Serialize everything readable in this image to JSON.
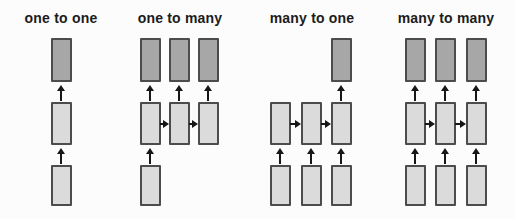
{
  "colors": {
    "background": "#fcfcfc",
    "box_border": "#4c4c4c",
    "input_fill": "#dbdbdb",
    "hidden_fill": "#dbdbdb",
    "output_fill": "#a7a7a7",
    "arrow": "#161616",
    "title_text": "#1b1b1b"
  },
  "layout": {
    "width": 515,
    "height": 219,
    "title_y": 10,
    "box_width": 21,
    "rows": {
      "output": {
        "y": 38,
        "height": 44
      },
      "hidden": {
        "y": 102,
        "height": 43
      },
      "input": {
        "y": 165,
        "height": 41
      }
    }
  },
  "panels": [
    {
      "id": "one-to-one",
      "label": "one to one",
      "title_center_x": 61,
      "columns": [
        {
          "x": 61,
          "input": true,
          "hidden": true,
          "output": true
        }
      ],
      "h_arrows": []
    },
    {
      "id": "one-to-many",
      "label": "one to many",
      "title_center_x": 180,
      "columns": [
        {
          "x": 150,
          "input": true,
          "hidden": true,
          "output": true
        },
        {
          "x": 179,
          "input": false,
          "hidden": true,
          "output": true
        },
        {
          "x": 208,
          "input": false,
          "hidden": true,
          "output": true
        }
      ],
      "h_arrows": [
        [
          0,
          1
        ],
        [
          1,
          2
        ]
      ]
    },
    {
      "id": "many-to-one",
      "label": "many to one",
      "title_center_x": 312,
      "columns": [
        {
          "x": 280,
          "input": true,
          "hidden": true,
          "output": false
        },
        {
          "x": 311,
          "input": true,
          "hidden": true,
          "output": false
        },
        {
          "x": 341,
          "input": true,
          "hidden": true,
          "output": true
        }
      ],
      "h_arrows": [
        [
          0,
          1
        ],
        [
          1,
          2
        ]
      ]
    },
    {
      "id": "many-to-many",
      "label": "many to many",
      "title_center_x": 446,
      "columns": [
        {
          "x": 415,
          "input": true,
          "hidden": true,
          "output": true
        },
        {
          "x": 445,
          "input": true,
          "hidden": true,
          "output": true
        },
        {
          "x": 476,
          "input": true,
          "hidden": true,
          "output": true
        }
      ],
      "h_arrows": [
        [
          0,
          1
        ],
        [
          1,
          2
        ]
      ]
    }
  ]
}
